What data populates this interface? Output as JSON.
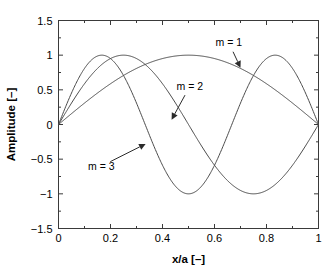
{
  "chart_data": {
    "type": "line",
    "title": "",
    "xlabel": "x/a [–]",
    "ylabel": "Amplitude [–]",
    "xlim": [
      0,
      1
    ],
    "ylim": [
      -1.5,
      1.5
    ],
    "grid": false,
    "legend": "none",
    "box": true,
    "tick_direction": "in",
    "xticks": [
      0,
      0.2,
      0.4,
      0.6,
      0.8,
      1
    ],
    "xticklabels": [
      "0",
      "0.2",
      "0.4",
      "0.6",
      "0.8",
      "1"
    ],
    "yticks": [
      -1.5,
      -1,
      -0.5,
      0,
      0.5,
      1,
      1.5
    ],
    "yticklabels": [
      "−1.5",
      "−1",
      "−0.5",
      "0",
      "0.5",
      "1",
      "1.5"
    ],
    "xminorticks": [
      0.1,
      0.3,
      0.5,
      0.7,
      0.9
    ],
    "yminorticks": [
      -1.25,
      -0.75,
      -0.25,
      0.25,
      0.75,
      1.25
    ],
    "formula": "y = sin(m * pi * x)",
    "series": [
      {
        "name": "m = 1",
        "m": 1,
        "color": "#4a4a4a",
        "x": [
          0,
          0.05,
          0.1,
          0.15,
          0.2,
          0.25,
          0.3,
          0.35,
          0.4,
          0.45,
          0.5,
          0.55,
          0.6,
          0.65,
          0.7,
          0.75,
          0.8,
          0.85,
          0.9,
          0.95,
          1
        ],
        "values": [
          0,
          0.156,
          0.309,
          0.454,
          0.588,
          0.707,
          0.809,
          0.891,
          0.951,
          0.988,
          1,
          0.988,
          0.951,
          0.891,
          0.809,
          0.707,
          0.588,
          0.454,
          0.309,
          0.156,
          0
        ]
      },
      {
        "name": "m = 2",
        "m": 2,
        "color": "#4a4a4a",
        "x": [
          0,
          0.05,
          0.1,
          0.15,
          0.2,
          0.25,
          0.3,
          0.35,
          0.4,
          0.45,
          0.5,
          0.55,
          0.6,
          0.65,
          0.7,
          0.75,
          0.8,
          0.85,
          0.9,
          0.95,
          1
        ],
        "values": [
          0,
          0.309,
          0.588,
          0.809,
          0.951,
          1,
          0.951,
          0.809,
          0.588,
          0.309,
          0,
          -0.309,
          -0.588,
          -0.809,
          -0.951,
          -1,
          -0.951,
          -0.809,
          -0.588,
          -0.309,
          0
        ]
      },
      {
        "name": "m = 3",
        "m": 3,
        "color": "#4a4a4a",
        "x": [
          0,
          0.05,
          0.1,
          0.15,
          0.2,
          0.25,
          0.3,
          0.35,
          0.4,
          0.45,
          0.5,
          0.55,
          0.6,
          0.65,
          0.7,
          0.75,
          0.8,
          0.85,
          0.9,
          0.95,
          1
        ],
        "values": [
          0,
          0.454,
          0.809,
          0.988,
          0.951,
          0.707,
          0.309,
          -0.156,
          -0.588,
          -0.891,
          -1,
          -0.891,
          -0.588,
          -0.156,
          0.309,
          0.707,
          0.951,
          0.988,
          0.809,
          0.454,
          0
        ]
      }
    ],
    "annotations": [
      {
        "id": "m1",
        "text": "m = 1",
        "label_x": 0.655,
        "label_y": 1.18,
        "point_x": 0.7,
        "point_y": 0.82
      },
      {
        "id": "m2",
        "text": "m = 2",
        "label_x": 0.505,
        "label_y": 0.55,
        "point_x": 0.435,
        "point_y": 0.07
      },
      {
        "id": "m3",
        "text": "m = 3",
        "label_x": 0.165,
        "label_y": -0.6,
        "point_x": 0.335,
        "point_y": -0.28
      }
    ]
  }
}
